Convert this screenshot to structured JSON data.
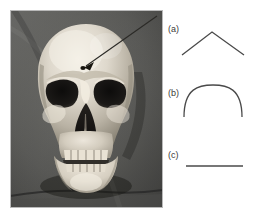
{
  "figure": {
    "type": "composite-figure",
    "background_color": "#ffffff",
    "line_color": "#4a4a4a"
  },
  "photo": {
    "name": "skull-photograph",
    "subject": "human skull, frontal view",
    "background_color": "#585858",
    "bone_color": "#d8d2c8",
    "cavity_color": "#1c1a18",
    "annotation": {
      "name": "arrow-annotation",
      "kind": "arrow",
      "points_to": "small dark foramen above left orbit",
      "color": "#2a2a2a"
    }
  },
  "diagram": {
    "name": "shape-diagram",
    "items": [
      {
        "key": "a",
        "label": "(a)",
        "shape": "chevron",
        "shape_name": "peaked-chevron-shape",
        "description": "inverted V / peaked gable outline"
      },
      {
        "key": "b",
        "label": "(b)",
        "shape": "arch",
        "shape_name": "rounded-arch-shape",
        "description": "semicircular dome outline"
      },
      {
        "key": "c",
        "label": "(c)",
        "shape": "line",
        "shape_name": "flat-line-shape",
        "description": "straight horizontal line"
      }
    ]
  }
}
